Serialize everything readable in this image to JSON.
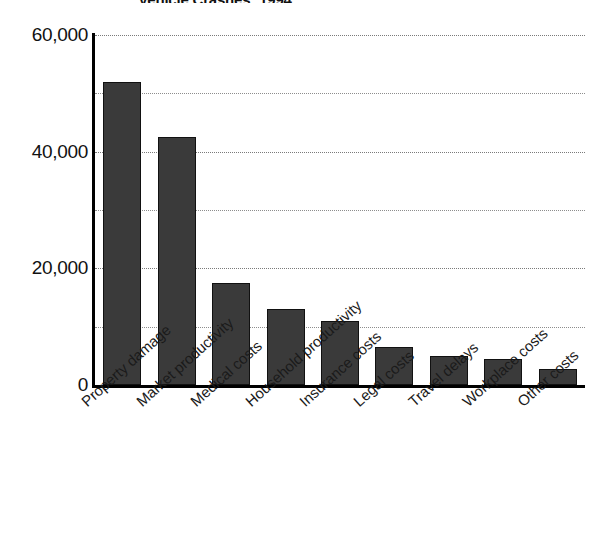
{
  "chart_data": {
    "type": "bar",
    "title": "Vehicle Crashes: 1994",
    "xlabel": "",
    "ylabel": "",
    "ylim": [
      0,
      60000
    ],
    "grid": true,
    "legend": null,
    "categories": [
      "Property damage",
      "Market productivity",
      "Medical costs",
      "Household productivity",
      "Insurance costs",
      "Legal costs",
      "Travel delays",
      "Workplace costs",
      "Other costs"
    ],
    "values": [
      52000,
      42500,
      17500,
      13000,
      11000,
      6500,
      5000,
      4500,
      2700
    ],
    "ytick_labels": [
      "0",
      "20,000",
      "40,000",
      "60,000"
    ],
    "ytick_values": [
      0,
      20000,
      40000,
      60000
    ],
    "gridline_values": [
      10000,
      20000,
      30000,
      40000,
      50000,
      60000
    ],
    "bar_color": "#3a3a3a",
    "bar_border_color": "#111111",
    "gridline_color": "#8d8d8d",
    "background_color": "#ffffff"
  }
}
